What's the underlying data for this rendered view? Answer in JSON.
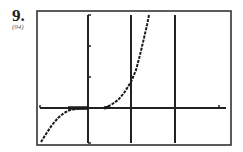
{
  "problem": {
    "number": "9.",
    "reference": "(94)"
  },
  "chart_data": {
    "type": "line",
    "title": "",
    "xlabel": "",
    "ylabel": "",
    "grid": false,
    "frame": {
      "x": 37,
      "y": 11,
      "w": 194,
      "h": 134
    },
    "x_axis": {
      "y": 108,
      "x1": 40,
      "x2": 226,
      "ticks_x": [
        219
      ]
    },
    "y_axis": {
      "x": 88,
      "y1": 15,
      "y2": 143,
      "ticks_y": [
        15,
        46,
        77,
        143
      ]
    },
    "asymptotes_x": [
      131,
      175
    ],
    "series": [
      {
        "name": "left-branch",
        "points": [
          [
            41,
            142
          ],
          [
            46,
            134
          ],
          [
            52,
            125
          ],
          [
            58,
            118
          ],
          [
            64,
            113
          ],
          [
            70,
            110
          ],
          [
            76,
            109
          ],
          [
            82,
            108.5
          ],
          [
            88,
            108
          ]
        ]
      },
      {
        "name": "right-branch",
        "points": [
          [
            104,
            108
          ],
          [
            111,
            105
          ],
          [
            118,
            100
          ],
          [
            124,
            93
          ],
          [
            131,
            82
          ],
          [
            136,
            70
          ],
          [
            140,
            55
          ],
          [
            144,
            38
          ],
          [
            147,
            25
          ],
          [
            149,
            15
          ]
        ]
      }
    ],
    "colors": {
      "axis": "#222222",
      "curve": "#1a1a1a",
      "frame": "#333333"
    }
  }
}
